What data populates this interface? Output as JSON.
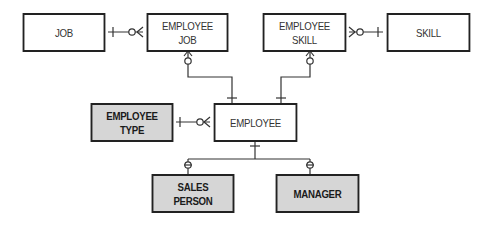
{
  "diagram": {
    "type": "entity-relationship",
    "entities": [
      {
        "id": "job",
        "label": "JOB",
        "shaded": false
      },
      {
        "id": "employee_job",
        "label": "EMPLOYEE\nJOB",
        "shaded": false
      },
      {
        "id": "employee_skill",
        "label": "EMPLOYEE\nSKILL",
        "shaded": false
      },
      {
        "id": "skill",
        "label": "SKILL",
        "shaded": false
      },
      {
        "id": "employee_type",
        "label": "EMPLOYEE\nTYPE",
        "shaded": true
      },
      {
        "id": "employee",
        "label": "EMPLOYEE",
        "shaded": false
      },
      {
        "id": "sales_person",
        "label": "SALES\nPERSON",
        "shaded": true
      },
      {
        "id": "manager",
        "label": "MANAGER",
        "shaded": true
      }
    ],
    "relationships": [
      {
        "from": "job",
        "to": "employee_job",
        "from_cardinality": "one",
        "to_cardinality": "zero-or-many"
      },
      {
        "from": "skill",
        "to": "employee_skill",
        "from_cardinality": "one",
        "to_cardinality": "zero-or-many"
      },
      {
        "from": "employee",
        "to": "employee_job",
        "from_cardinality": "one",
        "to_cardinality": "zero-or-many"
      },
      {
        "from": "employee",
        "to": "employee_skill",
        "from_cardinality": "one",
        "to_cardinality": "zero-or-many"
      },
      {
        "from": "employee_type",
        "to": "employee",
        "from_cardinality": "one",
        "to_cardinality": "zero-or-many"
      },
      {
        "from": "employee",
        "to": "sales_person",
        "from_cardinality": "one",
        "to_cardinality": "zero-or-one"
      },
      {
        "from": "employee",
        "to": "manager",
        "from_cardinality": "one",
        "to_cardinality": "zero-or-one"
      }
    ],
    "colors": {
      "line": "#333333",
      "shaded_fill": "#d6d6d6",
      "plain_fill": "#ffffff"
    }
  }
}
